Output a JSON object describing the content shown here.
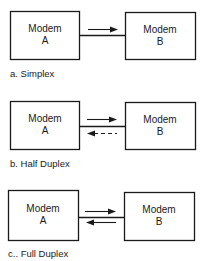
{
  "diagrams": [
    {
      "id": "simplex",
      "caption": "a. Simplex",
      "left_box": {
        "line1": "Modem",
        "line2": "A"
      },
      "right_box": {
        "line1": "Modem",
        "line2": "B"
      },
      "arrows": [
        {
          "direction": "right",
          "style": "solid"
        }
      ]
    },
    {
      "id": "half-duplex",
      "caption": "b. Half Duplex",
      "left_box": {
        "line1": "Modem",
        "line2": "A"
      },
      "right_box": {
        "line1": "Modem",
        "line2": "B"
      },
      "arrows": [
        {
          "direction": "right",
          "style": "solid"
        },
        {
          "direction": "left",
          "style": "dashed"
        }
      ]
    },
    {
      "id": "full-duplex",
      "caption": "c.. Full Duplex",
      "left_box": {
        "line1": "Modem",
        "line2": "A"
      },
      "right_box": {
        "line1": "Modem",
        "line2": "B"
      },
      "arrows": [
        {
          "direction": "right",
          "style": "solid"
        },
        {
          "direction": "left",
          "style": "solid"
        }
      ]
    }
  ]
}
